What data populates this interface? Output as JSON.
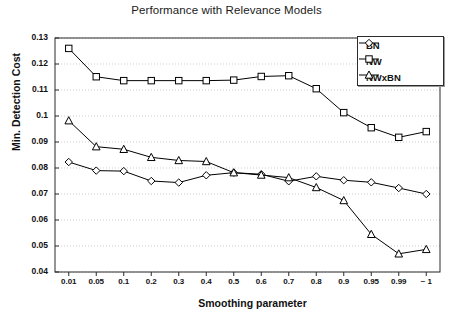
{
  "chart_data": {
    "type": "line",
    "title": "Performance with Relevance Models",
    "xlabel": "Smoothing parameter",
    "ylabel": "Min. Detection Cost",
    "categories": [
      "0.01",
      "0.05",
      "0.1",
      "0.2",
      "0.3",
      "0.4",
      "0.5",
      "0.6",
      "0.7",
      "0.8",
      "0.9",
      "0.95",
      "0.99",
      "~ 1"
    ],
    "ylim": [
      0.04,
      0.13
    ],
    "ytick_labels": [
      "0.13",
      "0.12",
      "0.11",
      "0.1",
      "0.09",
      "0.08",
      "0.07",
      "0.06",
      "0.05",
      "0.04"
    ],
    "ytick_values": [
      0.13,
      0.12,
      0.11,
      0.1,
      0.09,
      0.08,
      0.07,
      0.06,
      0.05,
      0.04
    ],
    "grid": true,
    "legend_position": "top-right",
    "series": [
      {
        "name": "BN",
        "marker": "diamond",
        "color": "#000000",
        "values": [
          0.0823,
          0.079,
          0.0788,
          0.075,
          0.0744,
          0.0772,
          0.0782,
          0.0776,
          0.0749,
          0.0768,
          0.0753,
          0.0745,
          0.0723,
          0.07
        ]
      },
      {
        "name": "NW",
        "marker": "square",
        "color": "#000000",
        "values": [
          0.126,
          0.1151,
          0.1136,
          0.1136,
          0.1136,
          0.1136,
          0.1138,
          0.1152,
          0.1155,
          0.1105,
          0.1013,
          0.0955,
          0.0918,
          0.094
        ]
      },
      {
        "name": "NWxBN",
        "marker": "triangle",
        "color": "#000000",
        "values": [
          0.0982,
          0.0882,
          0.0872,
          0.0841,
          0.0829,
          0.0825,
          0.0782,
          0.0773,
          0.0763,
          0.0725,
          0.0675,
          0.0545,
          0.047,
          0.0487
        ]
      }
    ]
  }
}
